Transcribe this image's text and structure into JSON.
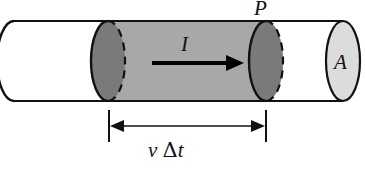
{
  "figure": {
    "kind": "physics-diagram",
    "width": 365,
    "height": 172,
    "background_color": "#ffffff"
  },
  "labels": {
    "point_P": "P",
    "current_I": "I",
    "area_A": "A",
    "length_v_delta_t_v": "v",
    "length_v_delta_t_delta": "Δ",
    "length_v_delta_t_t": "t"
  },
  "colors": {
    "outline": "#111111",
    "cylinder_body_unshaded": "#ffffff",
    "cylinder_body_shaded": "#a8a8a8",
    "endcap_dark": "#7a7a7a",
    "endcap_light": "#dcdcdc",
    "arrow": "#000000",
    "dimension_line": "#111111"
  },
  "geometry": {
    "cylinder_top_y": 21,
    "cylinder_bottom_y": 101,
    "cylinder_left_x": 14,
    "cylinder_right_x": 360,
    "ellipse_rx": 17,
    "ellipse_ry": 40,
    "shaded_left_cx": 108,
    "shaded_right_cx": 266,
    "right_cap_cx": 343,
    "current_arrow_y": 63,
    "current_arrow_x1": 152,
    "current_arrow_x2": 232,
    "dim_line_y": 125,
    "dim_tick_top_y": 110,
    "dim_tick_bottom_y": 142,
    "dim_left_x": 109,
    "dim_right_x": 266
  }
}
